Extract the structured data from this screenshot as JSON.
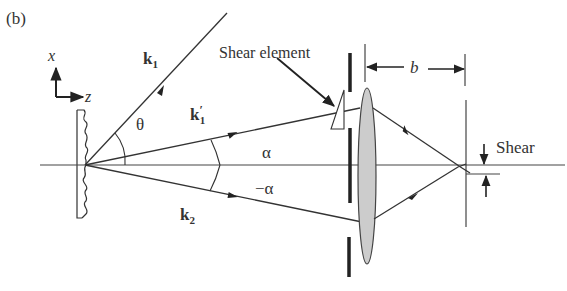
{
  "figure": {
    "panel_label": "(b)",
    "axes": {
      "x_label": "x",
      "z_label": "z"
    },
    "beams": {
      "k1": {
        "label": "k",
        "subscript": "1"
      },
      "k1_prime": {
        "label": "k",
        "prime": "′",
        "subscript": "1"
      },
      "k2": {
        "label": "k",
        "subscript": "2"
      }
    },
    "angles": {
      "theta": "θ",
      "alpha": "α",
      "neg_alpha": "−α"
    },
    "labels": {
      "shear_element": "Shear element",
      "distance_b": "b",
      "shear": "Shear"
    },
    "colors": {
      "line": "#333333",
      "lens_fill": "#cccccc"
    }
  }
}
